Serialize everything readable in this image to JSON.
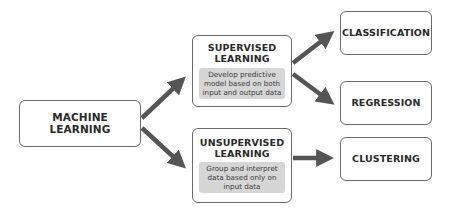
{
  "diagram": {
    "root": {
      "label": "MACHINE LEARNING"
    },
    "branches": [
      {
        "title_line1": "SUPERVISED",
        "title_line2": "LEARNING",
        "description": "Develop predictive model based on both input and output data",
        "outputs": [
          "CLASSIFICATION",
          "REGRESSION"
        ]
      },
      {
        "title_line1": "UNSUPERVISED",
        "title_line2": "LEARNING",
        "description": "Group and interpret data based only on input data",
        "outputs": [
          "CLUSTERING"
        ]
      }
    ],
    "leaves": {
      "classification": "CLASSIFICATION",
      "regression": "REGRESSION",
      "clustering": "CLUSTERING"
    },
    "colors": {
      "arrow": "#555555",
      "box_border": "#6a6a6a",
      "description_bg": "#d6d6d6"
    }
  }
}
